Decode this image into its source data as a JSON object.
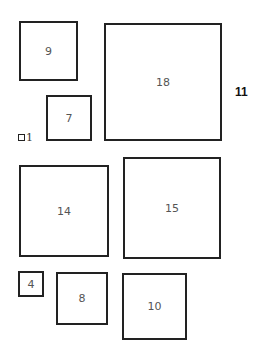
{
  "diagram": {
    "squares": [
      {
        "label": "9"
      },
      {
        "label": "18"
      },
      {
        "label": "7"
      },
      {
        "label": "1"
      },
      {
        "label": "14"
      },
      {
        "label": "15"
      },
      {
        "label": "4"
      },
      {
        "label": "8"
      },
      {
        "label": "10"
      }
    ],
    "side_label": "11"
  }
}
